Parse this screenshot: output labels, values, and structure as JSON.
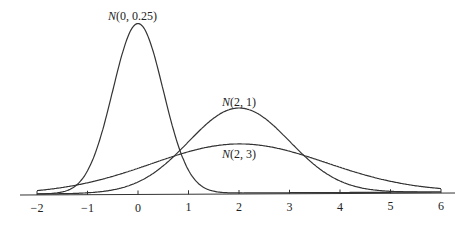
{
  "chart_data": {
    "type": "line",
    "title": "",
    "xlabel": "",
    "ylabel": "",
    "xlim": [
      -2.3,
      6.3
    ],
    "grid": false,
    "x_ticks": [
      -2,
      -1,
      0,
      1,
      2,
      3,
      4,
      5,
      6
    ],
    "x_tick_labels": [
      "−2",
      "−1",
      "0",
      "1",
      "2",
      "3",
      "4",
      "5",
      "6"
    ],
    "series": [
      {
        "name": "N(0, 0.25)",
        "mean": 0,
        "variance": 0.25,
        "label_x": 0,
        "peak_density": 0.798
      },
      {
        "name": "N(2, 1)",
        "mean": 2,
        "variance": 1,
        "label_x": 2,
        "peak_density": 0.399
      },
      {
        "name": "N(2, 3)",
        "mean": 2,
        "variance": 3,
        "label_x": 2.6,
        "peak_density": 0.23
      }
    ]
  },
  "labels": {
    "n0": {
      "italic": "N",
      "rest": "(0, 0.25)"
    },
    "n21": {
      "italic": "N",
      "rest": "(2, 1)"
    },
    "n23": {
      "italic": "N",
      "rest": "(2, 3)"
    }
  }
}
